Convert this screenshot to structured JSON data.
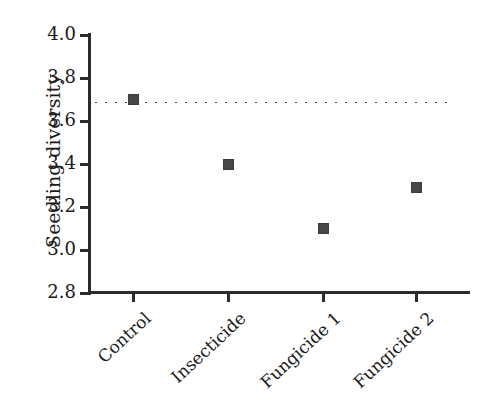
{
  "chart_data": {
    "type": "scatter",
    "title": "",
    "xlabel": "",
    "ylabel": "Seedling diversity",
    "categories": [
      "Control",
      "Insecticide",
      "Fungicide 1",
      "Fungicide 2"
    ],
    "values": [
      3.7,
      3.4,
      3.1,
      3.29
    ],
    "ylim": [
      2.8,
      4.0
    ],
    "ytick_values": [
      2.8,
      3.0,
      3.2,
      3.4,
      3.6,
      3.8,
      4.0
    ],
    "ytick_labels": [
      "2.8",
      "3.0",
      "3.2",
      "3.4",
      "3.6",
      "3.8",
      "4.0"
    ],
    "grid": false,
    "legend": null,
    "annotations": [
      {
        "name": "control-reference-line",
        "type": "horizontal-dotted-line",
        "y": 3.685,
        "style": "dotted",
        "color": "#4a4a4a"
      }
    ],
    "marker": {
      "shape": "square",
      "color": "#474747",
      "size_px": 11
    },
    "axis_color": "#2b2b2b"
  },
  "axis": {
    "y_label": "Seedling diversity"
  }
}
